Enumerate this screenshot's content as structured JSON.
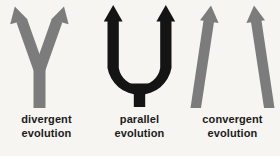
{
  "figure": {
    "background_color": "#f6f5f2",
    "text_color": "#1b1b1b",
    "gray_color": "#7c7c7c",
    "black_color": "#141414"
  },
  "panels": [
    {
      "key": "divergent",
      "icon": "diverging-arrows-icon",
      "color": "#7c7c7c",
      "arrow_count": 2,
      "caption_line1": "divergent",
      "caption_line2": "evolution"
    },
    {
      "key": "parallel",
      "icon": "parallel-arrows-icon",
      "color": "#141414",
      "arrow_count": 2,
      "caption_line1": "parallel",
      "caption_line2": "evolution"
    },
    {
      "key": "convergent",
      "icon": "converging-arrows-icon",
      "color": "#7c7c7c",
      "arrow_count": 2,
      "caption_line1": "convergent",
      "caption_line2": "evolution"
    }
  ]
}
